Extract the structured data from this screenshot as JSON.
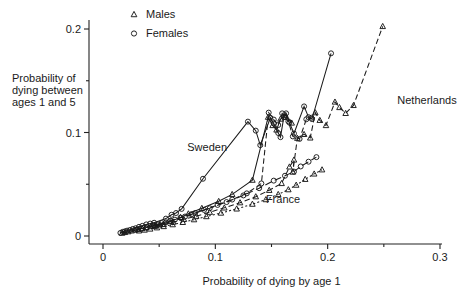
{
  "chart_data": {
    "type": "scatter",
    "title": "",
    "xlabel": "Probability of dying by age 1",
    "ylabel": "Probability of dying between ages 1 and 5",
    "ylabel_lines": [
      "Probability of",
      "dying between",
      "ages 1 and 5"
    ],
    "xlim": [
      0,
      0.3
    ],
    "ylim": [
      0,
      0.21
    ],
    "xticks": [
      0,
      0.1,
      0.2,
      0.3
    ],
    "xticklabels": [
      "0",
      "0.1",
      "0.2",
      "0.3"
    ],
    "xminorticks": [
      0.05,
      0.15,
      0.25
    ],
    "yticks": [
      0,
      0.1,
      0.2
    ],
    "yticklabels": [
      "0",
      "0.1",
      "0.2"
    ],
    "yminorticks": [
      0.05,
      0.15
    ],
    "grid": false,
    "legend_position": "top-left",
    "legend": [
      {
        "label": "Males",
        "marker": "triangle"
      },
      {
        "label": "Females",
        "marker": "circle"
      }
    ],
    "annotations": [
      {
        "text": "Sweden",
        "x": 0.075,
        "y": 0.082
      },
      {
        "text": "France",
        "x": 0.145,
        "y": 0.032
      },
      {
        "text": "Netherlands",
        "x": 0.262,
        "y": 0.128
      }
    ],
    "series": [
      {
        "name": "Sweden Females",
        "country": "Sweden",
        "sex": "Females",
        "marker": "circle",
        "linestyle": "solid",
        "points": [
          [
            0.0155,
            0.003
          ],
          [
            0.0175,
            0.004
          ],
          [
            0.0195,
            0.0045
          ],
          [
            0.0215,
            0.0052
          ],
          [
            0.024,
            0.0058
          ],
          [
            0.0265,
            0.0068
          ],
          [
            0.029,
            0.0075
          ],
          [
            0.032,
            0.0088
          ],
          [
            0.035,
            0.0098
          ],
          [
            0.0385,
            0.0112
          ],
          [
            0.042,
            0.012
          ],
          [
            0.0455,
            0.0128
          ],
          [
            0.056,
            0.0168
          ],
          [
            0.061,
            0.0205
          ],
          [
            0.065,
            0.0222
          ],
          [
            0.07,
            0.0262
          ],
          [
            0.089,
            0.0553
          ],
          [
            0.129,
            0.1105
          ],
          [
            0.136,
            0.1018
          ],
          [
            0.14,
            0.0878
          ],
          [
            0.149,
            0.1142
          ],
          [
            0.152,
            0.1088
          ],
          [
            0.156,
            0.0995
          ],
          [
            0.158,
            0.0955
          ],
          [
            0.161,
            0.115
          ],
          [
            0.163,
            0.1185
          ],
          [
            0.166,
            0.1095
          ],
          [
            0.17,
            0.099
          ],
          [
            0.179,
            0.1252
          ],
          [
            0.183,
            0.1148
          ],
          [
            0.186,
            0.113
          ],
          [
            0.203,
            0.1765
          ]
        ]
      },
      {
        "name": "Sweden Males",
        "country": "Sweden",
        "sex": "Males",
        "marker": "triangle",
        "linestyle": "solid",
        "points": [
          [
            0.017,
            0.0028
          ],
          [
            0.0195,
            0.0035
          ],
          [
            0.0225,
            0.0042
          ],
          [
            0.0255,
            0.005
          ],
          [
            0.0285,
            0.0058
          ],
          [
            0.0315,
            0.0065
          ],
          [
            0.035,
            0.0072
          ],
          [
            0.0385,
            0.0082
          ],
          [
            0.0425,
            0.0092
          ],
          [
            0.0465,
            0.01
          ],
          [
            0.051,
            0.011
          ],
          [
            0.06,
            0.014
          ],
          [
            0.069,
            0.018
          ],
          [
            0.076,
            0.0215
          ],
          [
            0.088,
            0.0268
          ],
          [
            0.103,
            0.0335
          ],
          [
            0.115,
            0.0402
          ],
          [
            0.133,
            0.054
          ],
          [
            0.147,
            0.1148
          ],
          [
            0.151,
            0.1068
          ],
          [
            0.1545,
            0.1025
          ],
          [
            0.158,
            0.113
          ],
          [
            0.1625,
            0.1165
          ],
          [
            0.168,
            0.1092
          ]
        ]
      },
      {
        "name": "France Females",
        "country": "France",
        "sex": "Females",
        "marker": "circle",
        "linestyle": "longdash",
        "points": [
          [
            0.03,
            0.0062
          ],
          [
            0.034,
            0.0072
          ],
          [
            0.039,
            0.0085
          ],
          [
            0.044,
            0.0098
          ],
          [
            0.049,
            0.0112
          ],
          [
            0.056,
            0.0132
          ],
          [
            0.064,
            0.0158
          ],
          [
            0.073,
            0.0188
          ],
          [
            0.082,
            0.0222
          ],
          [
            0.095,
            0.0268
          ],
          [
            0.11,
            0.0328
          ],
          [
            0.125,
            0.0392
          ],
          [
            0.139,
            0.0462
          ],
          [
            0.152,
            0.0535
          ],
          [
            0.162,
            0.0582
          ],
          [
            0.17,
            0.0622
          ],
          [
            0.176,
            0.0672
          ],
          [
            0.183,
            0.0718
          ],
          [
            0.19,
            0.0762
          ]
        ]
      },
      {
        "name": "France Males",
        "country": "France",
        "sex": "Males",
        "marker": "triangle",
        "linestyle": "dotted",
        "points": [
          [
            0.032,
            0.005
          ],
          [
            0.037,
            0.0058
          ],
          [
            0.042,
            0.0068
          ],
          [
            0.048,
            0.008
          ],
          [
            0.054,
            0.0092
          ],
          [
            0.062,
            0.011
          ],
          [
            0.071,
            0.0132
          ],
          [
            0.081,
            0.0158
          ],
          [
            0.092,
            0.0188
          ],
          [
            0.105,
            0.0222
          ],
          [
            0.119,
            0.0262
          ],
          [
            0.133,
            0.0308
          ],
          [
            0.145,
            0.0352
          ],
          [
            0.156,
            0.0402
          ],
          [
            0.165,
            0.0448
          ],
          [
            0.172,
            0.0492
          ],
          [
            0.18,
            0.0548
          ],
          [
            0.188,
            0.06
          ],
          [
            0.195,
            0.064
          ]
        ]
      },
      {
        "name": "Netherlands Females",
        "country": "Netherlands",
        "sex": "Females",
        "marker": "circle",
        "linestyle": "dashdot",
        "points": [
          [
            0.045,
            0.0105
          ],
          [
            0.052,
            0.0125
          ],
          [
            0.06,
            0.0148
          ],
          [
            0.069,
            0.0178
          ],
          [
            0.079,
            0.0212
          ],
          [
            0.09,
            0.0252
          ],
          [
            0.102,
            0.03
          ],
          [
            0.115,
            0.0352
          ],
          [
            0.128,
            0.0412
          ],
          [
            0.141,
            0.0508
          ],
          [
            0.1475,
            0.1192
          ],
          [
            0.152,
            0.1125
          ],
          [
            0.156,
            0.1072
          ],
          [
            0.1595,
            0.1185
          ],
          [
            0.162,
            0.1148
          ],
          [
            0.165,
            0.1108
          ],
          [
            0.169,
            0.0962
          ],
          [
            0.175,
            0.0938
          ],
          [
            0.181,
            0.1128
          ],
          [
            0.1855,
            0.1142
          ]
        ]
      },
      {
        "name": "Netherlands Males",
        "country": "Netherlands",
        "sex": "Males",
        "marker": "triangle",
        "linestyle": "dashdot",
        "points": [
          [
            0.046,
            0.0095
          ],
          [
            0.054,
            0.0112
          ],
          [
            0.0625,
            0.0135
          ],
          [
            0.072,
            0.0162
          ],
          [
            0.083,
            0.0192
          ],
          [
            0.095,
            0.023
          ],
          [
            0.108,
            0.0272
          ],
          [
            0.122,
            0.0322
          ],
          [
            0.136,
            0.038
          ],
          [
            0.148,
            0.0442
          ],
          [
            0.159,
            0.0508
          ],
          [
            0.166,
            0.0668
          ],
          [
            0.17,
            0.0735
          ],
          [
            0.169,
            0.0618
          ],
          [
            0.173,
            0.0945
          ],
          [
            0.179,
            0.0982
          ],
          [
            0.1845,
            0.0948
          ],
          [
            0.189,
            0.1192
          ],
          [
            0.193,
            0.1118
          ],
          [
            0.1985,
            0.1068
          ],
          [
            0.2065,
            0.1295
          ],
          [
            0.2105,
            0.1242
          ],
          [
            0.216,
            0.1185
          ],
          [
            0.223,
            0.1262
          ],
          [
            0.249,
            0.2025
          ]
        ]
      }
    ]
  }
}
